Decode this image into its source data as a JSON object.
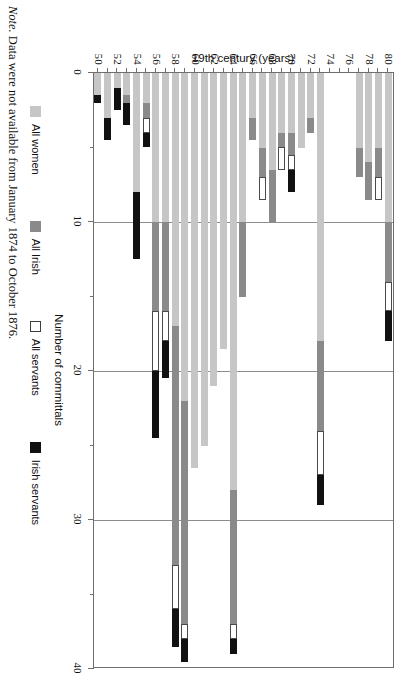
{
  "chart_data": {
    "type": "bar",
    "orientation": "horizontal-stacked",
    "title": "",
    "xlabel": "Number of committals",
    "ylabel": "19th century (years)",
    "xlim": [
      0,
      40
    ],
    "xticks": [
      0,
      10,
      20,
      30,
      40
    ],
    "xtick_labels": [
      "0",
      "10",
      "20",
      "30",
      "40"
    ],
    "xminor_ticks": [
      5,
      15,
      25,
      35
    ],
    "grid": "vertical gridlines at 10, 20, 30",
    "legend_position": "below-plot",
    "categories": [
      "50",
      "51",
      "52",
      "53",
      "54",
      "55",
      "56",
      "57",
      "58",
      "59",
      "60",
      "61",
      "62",
      "63",
      "64",
      "65",
      "66",
      "67",
      "68",
      "69",
      "70",
      "71",
      "72",
      "73",
      "74",
      "75",
      "76",
      "77",
      "78",
      "79",
      "80"
    ],
    "category_labels_shown": [
      "50",
      "52",
      "54",
      "56",
      "58",
      "60",
      "62",
      "64",
      "66",
      "68",
      "70",
      "72",
      "74",
      "76",
      "78",
      "80"
    ],
    "missing_categories": [
      "74",
      "75",
      "76"
    ],
    "series": [
      {
        "name": "All women",
        "color": "#c6c6c6",
        "values": [
          1.5,
          3.0,
          1.0,
          1.5,
          8.0,
          2.0,
          10.0,
          10.0,
          17.0,
          22.0,
          26.5,
          25.0,
          21.0,
          18.5,
          28.0,
          10.0,
          3.0,
          5.0,
          6.5,
          4.0,
          4.0,
          5.0,
          3.0,
          18.0,
          0,
          0,
          2.0,
          5.0,
          6.0,
          5.0,
          10.0
        ]
      },
      {
        "name": "All Irish",
        "color": "#8a8a8a",
        "values": [
          0,
          0,
          0,
          0.5,
          0,
          1.0,
          6.0,
          6.0,
          16.0,
          15.0,
          0,
          0,
          0,
          0,
          9.0,
          5.0,
          1.5,
          2.0,
          3.5,
          1.0,
          1.5,
          0,
          1.0,
          6.0,
          0,
          0,
          1.0,
          2.0,
          2.5,
          2.0,
          4.0
        ]
      },
      {
        "name": "All servants",
        "color": "#ffffff",
        "values": [
          0,
          0,
          0,
          0,
          0,
          1.0,
          4.0,
          2.0,
          3.0,
          1.0,
          0,
          0,
          0,
          0,
          1.0,
          0,
          0,
          1.5,
          0,
          1.5,
          1.0,
          0,
          0,
          3.0,
          0,
          0,
          1.0,
          0,
          0,
          1.5,
          2.0
        ]
      },
      {
        "name": "Irish servants",
        "color": "#111111",
        "values": [
          0.5,
          1.5,
          1.5,
          1.5,
          4.5,
          1.0,
          4.5,
          2.5,
          2.5,
          1.5,
          0,
          0,
          0,
          0,
          1.0,
          0,
          0,
          0,
          0,
          0,
          1.5,
          0,
          0,
          2.0,
          0,
          0,
          0,
          0,
          0,
          0,
          2.0
        ]
      }
    ]
  },
  "legend": {
    "items": [
      {
        "label": "All women",
        "swatch": "women"
      },
      {
        "label": "All Irish",
        "swatch": "irish"
      },
      {
        "label": "All servants",
        "swatch": "serv"
      },
      {
        "label": "Irish servants",
        "swatch": "irserv"
      }
    ]
  },
  "note": {
    "prefix": "Note.",
    "text": " Data were not available from January 1874 to October 1876."
  }
}
